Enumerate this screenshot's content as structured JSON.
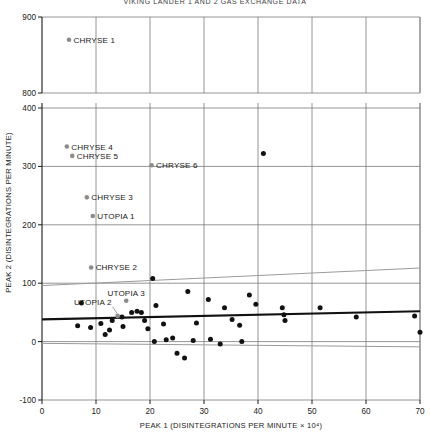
{
  "figure": {
    "title": "VIKING LANDER 1 AND 2 GAS EXCHANGE DATA",
    "background": "#ffffff"
  },
  "chart_data": {
    "type": "scatter",
    "title": "",
    "xlabel": "PEAK 1 (DISINTEGRATIONS PER MINUTE × 10⁴)",
    "ylabel": "PEAK 2 (DISINTEGRATIONS PER MINUTE)",
    "xlim": [
      0,
      70
    ],
    "xticks": [
      0,
      10,
      20,
      30,
      40,
      50,
      60,
      70
    ],
    "xticklabels": [
      "0",
      "10",
      "20",
      "30",
      "40",
      "50",
      "60",
      "70"
    ],
    "ylim": [
      -100,
      900
    ],
    "yticks": [
      -100,
      0,
      100,
      200,
      300,
      400,
      800,
      900
    ],
    "yticklabels": [
      "-100",
      "0",
      "100",
      "200",
      "300",
      "400",
      "800",
      "900"
    ],
    "axis_break": {
      "between": [
        400,
        800
      ],
      "axis": "y"
    },
    "grid": true,
    "grid_color": "#7a7a7a",
    "legend": "none",
    "labeled_points": [
      {
        "label": "CHRYSE 1",
        "x": 5.0,
        "y": 870,
        "color": "#8c8c8c",
        "label_side": "right"
      },
      {
        "label": "CHRYSE 4",
        "x": 4.6,
        "y": 334,
        "color": "#8c8c8c",
        "label_side": "right"
      },
      {
        "label": "CHRYSE 5",
        "x": 5.6,
        "y": 318,
        "color": "#8c8c8c",
        "label_side": "right"
      },
      {
        "label": "CHRYSE 6",
        "x": 20.3,
        "y": 302,
        "color": "#8c8c8c",
        "label_side": "right"
      },
      {
        "label": "CHRYSE 3",
        "x": 8.3,
        "y": 247,
        "color": "#8c8c8c",
        "label_side": "right"
      },
      {
        "label": "UTOPIA 1",
        "x": 9.4,
        "y": 215,
        "color": "#8c8c8c",
        "label_side": "right"
      },
      {
        "label": "CHRYSE 2",
        "x": 9.1,
        "y": 127,
        "color": "#8c8c8c",
        "label_side": "right"
      },
      {
        "label": "UTOPIA 3",
        "x": 15.6,
        "y": 70,
        "color": "#8c8c8c",
        "label_side": "above"
      },
      {
        "label": "UTOPIA 2",
        "x": 14.0,
        "y": 44,
        "color": "#8c8c8c",
        "label_side": "above-left"
      }
    ],
    "points": [
      {
        "x": 41.0,
        "y": 322
      },
      {
        "x": 20.5,
        "y": 108
      },
      {
        "x": 7.3,
        "y": 66
      },
      {
        "x": 27.0,
        "y": 86
      },
      {
        "x": 21.1,
        "y": 62
      },
      {
        "x": 30.8,
        "y": 72
      },
      {
        "x": 33.8,
        "y": 58
      },
      {
        "x": 38.4,
        "y": 80
      },
      {
        "x": 39.6,
        "y": 64
      },
      {
        "x": 16.6,
        "y": 50
      },
      {
        "x": 17.6,
        "y": 52
      },
      {
        "x": 18.4,
        "y": 50
      },
      {
        "x": 14.8,
        "y": 42
      },
      {
        "x": 10.9,
        "y": 31
      },
      {
        "x": 13.0,
        "y": 36
      },
      {
        "x": 12.5,
        "y": 20
      },
      {
        "x": 11.7,
        "y": 12
      },
      {
        "x": 6.6,
        "y": 27
      },
      {
        "x": 9.0,
        "y": 24
      },
      {
        "x": 15.0,
        "y": 26
      },
      {
        "x": 19.0,
        "y": 36
      },
      {
        "x": 19.6,
        "y": 22
      },
      {
        "x": 22.5,
        "y": 30
      },
      {
        "x": 23.0,
        "y": 3
      },
      {
        "x": 20.8,
        "y": 0
      },
      {
        "x": 24.2,
        "y": 6
      },
      {
        "x": 25.0,
        "y": -20
      },
      {
        "x": 26.4,
        "y": -28
      },
      {
        "x": 28.6,
        "y": 32
      },
      {
        "x": 28.0,
        "y": 2
      },
      {
        "x": 31.2,
        "y": 4
      },
      {
        "x": 33.0,
        "y": -4
      },
      {
        "x": 35.2,
        "y": 38
      },
      {
        "x": 36.6,
        "y": 28
      },
      {
        "x": 37.0,
        "y": 0
      },
      {
        "x": 44.5,
        "y": 58
      },
      {
        "x": 44.8,
        "y": 46
      },
      {
        "x": 45.0,
        "y": 36
      },
      {
        "x": 51.5,
        "y": 58
      },
      {
        "x": 58.2,
        "y": 42
      },
      {
        "x": 69.0,
        "y": 44
      },
      {
        "x": 70.0,
        "y": 16
      }
    ],
    "fit_lines": [
      {
        "name": "regression-line",
        "color": "#111111",
        "width": 2.1,
        "x0": 0,
        "y0": 38,
        "x1": 70,
        "y1": 52
      },
      {
        "name": "upper-confidence-line",
        "color": "#9a9a9a",
        "width": 1.0,
        "x0": 0,
        "y0": 96,
        "x1": 70,
        "y1": 126
      },
      {
        "name": "lower-confidence-line",
        "color": "#9a9a9a",
        "width": 1.0,
        "x0": 0,
        "y0": -3,
        "x1": 70,
        "y1": -9
      }
    ]
  }
}
